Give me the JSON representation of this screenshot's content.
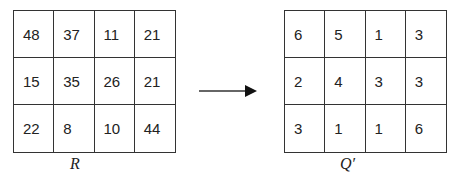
{
  "left_matrix": {
    "label": "R",
    "rows": [
      [
        "48",
        "37",
        "11",
        "21"
      ],
      [
        "15",
        "35",
        "26",
        "21"
      ],
      [
        "22",
        "8",
        "10",
        "44"
      ]
    ]
  },
  "right_matrix": {
    "label": "Q′",
    "rows": [
      [
        "6",
        "5",
        "1",
        "3"
      ],
      [
        "2",
        "4",
        "3",
        "3"
      ],
      [
        "3",
        "1",
        "1",
        "6"
      ]
    ]
  },
  "arrow": {
    "icon": "arrow-right-icon",
    "direction": "right"
  },
  "colors": {
    "line": "#333333",
    "text": "#222222",
    "background": "#ffffff"
  }
}
